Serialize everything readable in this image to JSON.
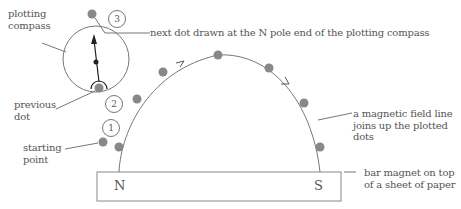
{
  "labels": {
    "plotting_compass": [
      "plotting",
      "compass"
    ],
    "next_dot": "next dot drawn at the N pole end of the plotting compass",
    "previous_dot": [
      "previous",
      "dot"
    ],
    "starting_point": [
      "starting",
      "point"
    ],
    "field_line": [
      "a magnetic field line",
      "joins up the plotted",
      "dots"
    ],
    "bar_magnet": [
      "bar magnet on top",
      "of a sheet of paper"
    ]
  },
  "magnet": {
    "north_label": "N",
    "south_label": "S"
  },
  "steps": [
    "1",
    "2",
    "3"
  ],
  "colors": {
    "dot": "#888888",
    "line": "#777777",
    "text": "#555555",
    "needle": "#222222"
  }
}
